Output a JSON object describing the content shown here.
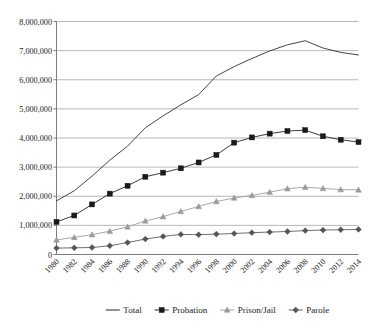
{
  "chart_data": {
    "type": "line",
    "title": "",
    "subtitle": "",
    "xlabel": "",
    "ylabel": "",
    "xlim": [
      1980,
      2014
    ],
    "ylim": [
      0,
      8000000
    ],
    "grid": "horizontal",
    "legend_position": "bottom",
    "x": [
      1980,
      1982,
      1984,
      1986,
      1988,
      1990,
      1992,
      1994,
      1996,
      1998,
      2000,
      2002,
      2004,
      2006,
      2008,
      2010,
      2012,
      2014
    ],
    "categories": [
      "1980",
      "1982",
      "1984",
      "1986",
      "1988",
      "1990",
      "1992",
      "1994",
      "1996",
      "1998",
      "2000",
      "2002",
      "2004",
      "2006",
      "2008",
      "2010",
      "2012",
      "2014"
    ],
    "ytick_labels": [
      "0",
      "1,000,000",
      "2,000,000",
      "3,000,000",
      "4,000,000",
      "5,000,000",
      "6,000,000",
      "7,000,000",
      "8,000,000"
    ],
    "ytick_values": [
      0,
      1000000,
      2000000,
      3000000,
      4000000,
      5000000,
      6000000,
      7000000,
      8000000
    ],
    "series": [
      {
        "name": "Total",
        "marker": "none",
        "color": "#3b3b3b",
        "values": [
          1840000,
          2190000,
          2690000,
          3240000,
          3720000,
          4350000,
          4760000,
          5140000,
          5490000,
          6130000,
          6450000,
          6730000,
          6990000,
          7200000,
          7340000,
          7090000,
          6940000,
          6850000
        ]
      },
      {
        "name": "Probation",
        "marker": "square",
        "color": "#1a1a1a",
        "values": [
          1120000,
          1340000,
          1720000,
          2090000,
          2360000,
          2670000,
          2810000,
          2960000,
          3160000,
          3420000,
          3840000,
          4020000,
          4150000,
          4240000,
          4270000,
          4060000,
          3940000,
          3860000
        ]
      },
      {
        "name": "Prison/Jail",
        "marker": "triangle",
        "color": "#9b9b9b",
        "values": [
          500000,
          590000,
          680000,
          800000,
          950000,
          1150000,
          1300000,
          1480000,
          1650000,
          1820000,
          1940000,
          2030000,
          2140000,
          2260000,
          2310000,
          2270000,
          2230000,
          2220000
        ]
      },
      {
        "name": "Parole",
        "marker": "diamond",
        "color": "#555555",
        "values": [
          220000,
          230000,
          240000,
          300000,
          410000,
          530000,
          620000,
          690000,
          680000,
          700000,
          720000,
          750000,
          770000,
          790000,
          820000,
          840000,
          850000,
          860000
        ]
      }
    ]
  },
  "legend": {
    "items": [
      {
        "label": "Total",
        "marker": "none",
        "color": "#3b3b3b"
      },
      {
        "label": "Probation",
        "marker": "square",
        "color": "#1a1a1a"
      },
      {
        "label": "Prison/Jail",
        "marker": "triangle",
        "color": "#9b9b9b"
      },
      {
        "label": "Parole",
        "marker": "diamond",
        "color": "#555555"
      }
    ]
  }
}
